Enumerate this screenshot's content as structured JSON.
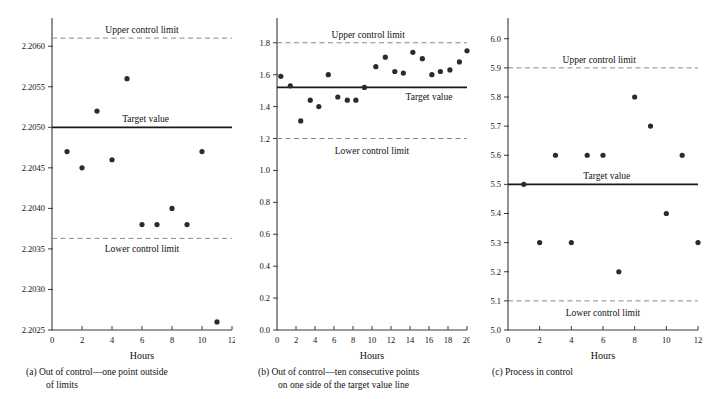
{
  "figure": {
    "xlabel": "Hours",
    "labels": {
      "ucl": "Upper control limit",
      "lcl": "Lower control limit",
      "target": "Target value"
    }
  },
  "captions": {
    "a": {
      "tag": "(a)",
      "line1": "Out of control—one point outside",
      "line2": "of limits"
    },
    "b": {
      "tag": "(b)",
      "line1": "Out of control—ten consecutive points",
      "line2": "on one side of the target value line"
    },
    "c": {
      "tag": "(c)",
      "line1": "Process in control",
      "line2": ""
    }
  },
  "colors": {
    "axis": "#3a3a3a",
    "point": "#2b2b2b",
    "target_line": "#1a1a1a",
    "limit_line": "#8a8a8a",
    "text": "#111111"
  },
  "chart_data": [
    {
      "type": "scatter",
      "id": "a",
      "title": "",
      "xlabel": "Hours",
      "ylabel": "",
      "xlim": [
        0,
        12
      ],
      "ylim": [
        2.2025,
        2.2062
      ],
      "xticks": [
        0,
        2,
        4,
        6,
        8,
        10,
        12
      ],
      "xticklabels": [
        "0",
        "2",
        "4",
        "6",
        "8",
        "10",
        "12"
      ],
      "yticks": [
        2.2025,
        2.203,
        2.2035,
        2.204,
        2.2045,
        2.205,
        2.2055,
        2.206
      ],
      "yticklabels": [
        "2.2025",
        "2.2030",
        "2.2035",
        "2.2040",
        "2.2045",
        "2.2050",
        "2.2055",
        "2.2060"
      ],
      "grid": false,
      "legend": "none",
      "target_value": 2.205,
      "upper_control_limit": 2.2061,
      "lower_control_limit": 2.20363,
      "x": [
        1,
        2,
        3,
        4,
        5,
        6,
        7,
        8,
        9,
        10,
        11
      ],
      "values": [
        2.2047,
        2.2045,
        2.2052,
        2.2046,
        2.2056,
        2.2038,
        2.2038,
        2.204,
        2.2038,
        2.2047,
        2.2026
      ],
      "annotations": [
        "Upper control limit",
        "Target value",
        "Lower control limit"
      ]
    },
    {
      "type": "scatter",
      "id": "b",
      "title": "",
      "xlabel": "Hours",
      "ylabel": "",
      "xlim": [
        0,
        20
      ],
      "ylim": [
        0.0,
        1.88
      ],
      "xticks": [
        0,
        2,
        4,
        6,
        8,
        10,
        12,
        14,
        16,
        18,
        20
      ],
      "xticklabels": [
        "0",
        "2",
        "4",
        "6",
        "8",
        "10",
        "12",
        "14",
        "16",
        "18",
        "20"
      ],
      "yticks": [
        0.0,
        0.2,
        0.4,
        0.6,
        0.8,
        1.0,
        1.2,
        1.4,
        1.6,
        1.8
      ],
      "yticklabels": [
        "0.0",
        "0.2",
        "0.4",
        "0.6",
        "0.8",
        "1.0",
        "1.2",
        "1.4",
        "1.6",
        "1.8"
      ],
      "grid": false,
      "legend": "none",
      "target_value": 1.52,
      "upper_control_limit": 1.8,
      "lower_control_limit": 1.2,
      "x": [
        0.4,
        1.4,
        2.5,
        3.5,
        4.4,
        5.4,
        6.4,
        7.4,
        8.3,
        9.2,
        10.4,
        11.4,
        12.4,
        13.3,
        14.3,
        15.3,
        16.3,
        17.2,
        18.2,
        19.2,
        20.0
      ],
      "values": [
        1.59,
        1.53,
        1.31,
        1.44,
        1.4,
        1.6,
        1.46,
        1.44,
        1.44,
        1.52,
        1.65,
        1.71,
        1.62,
        1.61,
        1.74,
        1.7,
        1.6,
        1.62,
        1.63,
        1.68,
        1.75
      ],
      "annotations": [
        "Upper control limit",
        "Target value",
        "Lower control limit"
      ]
    },
    {
      "type": "scatter",
      "id": "c",
      "title": "",
      "xlabel": "Hours",
      "ylabel": "",
      "xlim": [
        0,
        12
      ],
      "ylim": [
        5.0,
        6.03
      ],
      "xticks": [
        0,
        2,
        4,
        6,
        8,
        10,
        12
      ],
      "xticklabels": [
        "0",
        "2",
        "4",
        "6",
        "8",
        "10",
        "12"
      ],
      "yticks": [
        5.0,
        5.1,
        5.2,
        5.3,
        5.4,
        5.5,
        5.6,
        5.7,
        5.8,
        5.9,
        6.0
      ],
      "yticklabels": [
        "5.0",
        "5.1",
        "5.2",
        "5.3",
        "5.4",
        "5.5",
        "5.6",
        "5.7",
        "5.8",
        "5.9",
        "6.0"
      ],
      "grid": false,
      "legend": "none",
      "target_value": 5.5,
      "upper_control_limit": 5.9,
      "lower_control_limit": 5.1,
      "x": [
        1,
        2,
        3,
        4,
        5,
        6,
        7,
        8,
        9,
        10,
        11,
        12
      ],
      "values": [
        5.5,
        5.3,
        5.6,
        5.3,
        5.6,
        5.6,
        5.2,
        5.8,
        5.7,
        5.4,
        5.6,
        5.3
      ],
      "annotations": [
        "Upper control limit",
        "Target value",
        "Lower control limit"
      ]
    }
  ]
}
